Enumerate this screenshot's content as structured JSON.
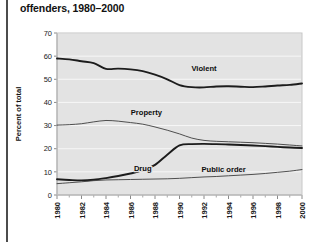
{
  "figure": {
    "title": "offenders, 1980–2000",
    "background": "#ffffff",
    "plot_background": "#e3e3e3"
  },
  "chart_data": {
    "type": "line",
    "title": "offenders, 1980–2000",
    "xlabel": "",
    "ylabel": "Percent of total",
    "xlim": [
      1980,
      2000
    ],
    "ylim": [
      0,
      70
    ],
    "yticks": [
      0,
      10,
      20,
      30,
      40,
      50,
      60,
      70
    ],
    "xticks": [
      1980,
      1982,
      1984,
      1986,
      1988,
      1990,
      1992,
      1994,
      1996,
      1998,
      2000
    ],
    "xtick_labels": [
      "1980",
      "1982",
      "1984",
      "1986",
      "1988",
      "1990",
      "1992",
      "1994",
      "1996",
      "1998",
      "2000"
    ],
    "ytick_labels": [
      "0",
      "10",
      "20",
      "30",
      "40",
      "50",
      "60",
      "70"
    ],
    "grid": true,
    "grid_axis": "y",
    "legend": "inline-labels",
    "x": [
      1980,
      1981,
      1982,
      1983,
      1984,
      1985,
      1986,
      1987,
      1988,
      1989,
      1990,
      1991,
      1992,
      1993,
      1994,
      1995,
      1996,
      1997,
      1998,
      1999,
      2000
    ],
    "series": [
      {
        "name": "Violent",
        "label": "Violent",
        "emphasis": "thick",
        "values": [
          59.0,
          58.6,
          57.8,
          57.0,
          54.5,
          54.6,
          54.3,
          53.5,
          52.0,
          50.0,
          47.5,
          46.6,
          46.5,
          46.9,
          47.0,
          46.8,
          46.6,
          46.9,
          47.3,
          47.6,
          48.2
        ]
      },
      {
        "name": "Property",
        "label": "Property",
        "emphasis": "thin",
        "values": [
          30.2,
          30.4,
          30.8,
          31.6,
          32.2,
          31.9,
          31.3,
          30.6,
          29.4,
          28.0,
          26.4,
          24.6,
          23.6,
          23.2,
          23.0,
          22.8,
          22.6,
          22.3,
          22.0,
          21.6,
          21.2
        ]
      },
      {
        "name": "Drug",
        "label": "Drug",
        "emphasis": "thick",
        "values": [
          6.8,
          6.5,
          6.3,
          6.6,
          7.3,
          8.2,
          9.3,
          10.6,
          13.0,
          17.4,
          21.4,
          22.0,
          22.1,
          22.0,
          21.8,
          21.6,
          21.4,
          21.1,
          20.8,
          20.5,
          20.3
        ]
      },
      {
        "name": "Public order",
        "label": "Public order",
        "emphasis": "thin",
        "values": [
          4.9,
          5.3,
          5.7,
          6.2,
          6.5,
          6.6,
          6.7,
          6.8,
          6.9,
          7.0,
          7.2,
          7.5,
          7.8,
          8.0,
          8.3,
          8.6,
          8.9,
          9.3,
          9.8,
          10.3,
          11.0
        ]
      }
    ],
    "series_label_positions": [
      {
        "name": "Violent",
        "x": 1992.0,
        "y": 53.5
      },
      {
        "name": "Property",
        "x": 1987.3,
        "y": 34.5
      },
      {
        "name": "Drug",
        "x": 1987.0,
        "y": 10.5
      },
      {
        "name": "Public order",
        "x": 1993.6,
        "y": 10.0
      }
    ]
  }
}
